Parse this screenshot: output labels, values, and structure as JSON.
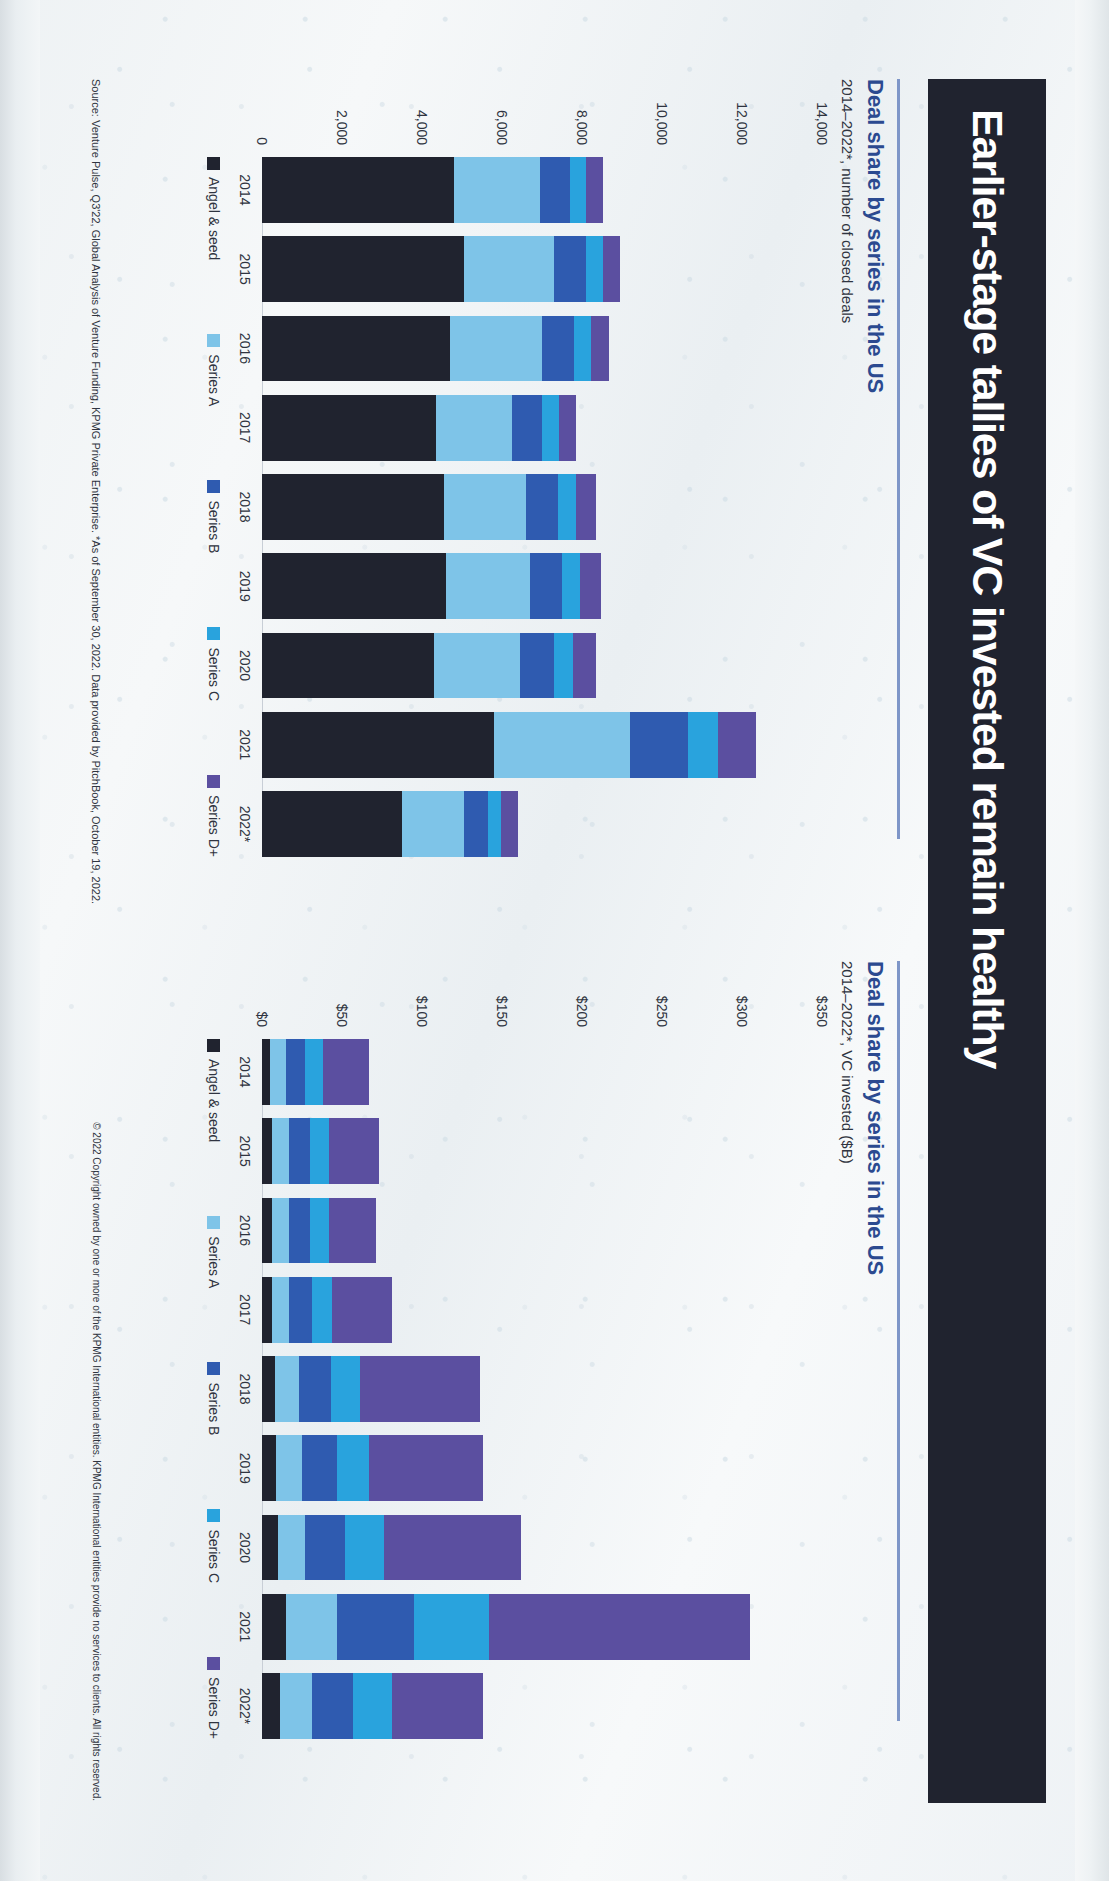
{
  "slide": {
    "title": "Earlier-stage tallies of VC invested remain healthy",
    "banner_color": "#20232f",
    "source": "Source: Venture Pulse, Q3'22, Global Analysis of Venture Funding, KPMG Private Enterprise. *As of September 30, 2022. Data provided by PitchBook, October 19, 2022.",
    "copyright": "© 2022 Copyright owned by one or more of the KPMG International entities. KPMG International entities provide no services to clients. All rights reserved."
  },
  "palette": {
    "angel_seed": "#20232f",
    "series_a": "#7ec4e8",
    "series_b": "#2f5bb0",
    "series_c": "#29a3dd",
    "series_d_plus": "#5b4fa0",
    "accent_blue": "#2b4a90",
    "rule": "#7e96c8"
  },
  "legend": [
    {
      "label": "Angel & seed",
      "color": "#20232f"
    },
    {
      "label": "Series A",
      "color": "#7ec4e8"
    },
    {
      "label": "Series B",
      "color": "#2f5bb0"
    },
    {
      "label": "Series C",
      "color": "#29a3dd"
    },
    {
      "label": "Series D+",
      "color": "#5b4fa0"
    }
  ],
  "chart_data": [
    {
      "id": "deals",
      "type": "bar",
      "stacked": true,
      "orientation": "vertical",
      "title": "Deal share by series in the US",
      "subtitle": "2014–2022*, number of closed deals",
      "xlabel": "",
      "ylabel": "number of closed deals",
      "ylim": [
        0,
        14000
      ],
      "yticks": [
        0,
        2000,
        4000,
        6000,
        8000,
        10000,
        12000,
        14000
      ],
      "ytick_labels": [
        "0",
        "2,000",
        "4,000",
        "6,000",
        "8,000",
        "10,000",
        "12,000",
        "14,000"
      ],
      "grid": false,
      "legend_position": "bottom",
      "categories": [
        "2014",
        "2015",
        "2016",
        "2017",
        "2018",
        "2019",
        "2020",
        "2021",
        "2022*"
      ],
      "series": [
        {
          "name": "Angel & seed",
          "color": "#20232f",
          "values": [
            4800,
            5050,
            4700,
            4350,
            4550,
            4600,
            4300,
            5800,
            3500
          ]
        },
        {
          "name": "Series A",
          "color": "#7ec4e8",
          "values": [
            2150,
            2250,
            2300,
            1900,
            2050,
            2100,
            2150,
            3400,
            1550
          ]
        },
        {
          "name": "Series B",
          "color": "#2f5bb0",
          "values": [
            750,
            800,
            800,
            750,
            800,
            800,
            850,
            1450,
            600
          ]
        },
        {
          "name": "Series C",
          "color": "#29a3dd",
          "values": [
            400,
            420,
            430,
            420,
            450,
            450,
            480,
            750,
            330
          ]
        },
        {
          "name": "Series D+",
          "color": "#5b4fa0",
          "values": [
            420,
            430,
            450,
            440,
            500,
            520,
            570,
            950,
            420
          ]
        }
      ]
    },
    {
      "id": "invested",
      "type": "bar",
      "stacked": true,
      "orientation": "vertical",
      "title": "Deal share by series in the US",
      "subtitle": "2014–2022*, VC invested ($B)",
      "xlabel": "",
      "ylabel": "VC invested ($B)",
      "ylim": [
        0,
        350
      ],
      "yticks": [
        0,
        50,
        100,
        150,
        200,
        250,
        300,
        350
      ],
      "ytick_labels": [
        "$0",
        "$50",
        "$100",
        "$150",
        "$200",
        "$250",
        "$300",
        "$350"
      ],
      "grid": false,
      "legend_position": "bottom",
      "categories": [
        "2014",
        "2015",
        "2016",
        "2017",
        "2018",
        "2019",
        "2020",
        "2021",
        "2022*"
      ],
      "series": [
        {
          "name": "Angel & seed",
          "color": "#20232f",
          "values": [
            5,
            6,
            6,
            6,
            8,
            9,
            10,
            15,
            11
          ]
        },
        {
          "name": "Series A",
          "color": "#7ec4e8",
          "values": [
            10,
            11,
            11,
            11,
            15,
            16,
            17,
            32,
            20
          ]
        },
        {
          "name": "Series B",
          "color": "#2f5bb0",
          "values": [
            12,
            13,
            13,
            14,
            20,
            22,
            25,
            48,
            26
          ]
        },
        {
          "name": "Series C",
          "color": "#29a3dd",
          "values": [
            11,
            12,
            12,
            13,
            18,
            20,
            24,
            47,
            24
          ]
        },
        {
          "name": "Series D+",
          "color": "#5b4fa0",
          "values": [
            29,
            31,
            29,
            37,
            75,
            71,
            86,
            163,
            57
          ]
        }
      ]
    }
  ]
}
